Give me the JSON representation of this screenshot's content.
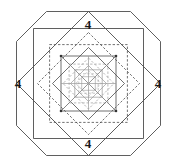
{
  "figure": {
    "type": "geometric-diagram",
    "width": 177,
    "height": 167,
    "background_color": "#ffffff",
    "stroke_color": "#4d4d4d",
    "stroke_color_light": "#9a9a9a",
    "stroke_color_dark": "#333333",
    "label_color": "#1a1a1a"
  },
  "labels": {
    "top": "4",
    "left": "4",
    "right": "4",
    "bottom": "4"
  },
  "geometry": {
    "center": {
      "x": 88.5,
      "y": 83.5
    },
    "octagon": {
      "name": "outer-octagon",
      "half_width": 72,
      "cut": 30,
      "stroke": "solid"
    },
    "levels": [
      {
        "level": 0,
        "shape": "square",
        "half_size": 55.0,
        "stroke": "solid",
        "weight": 0.9
      },
      {
        "level": 0,
        "shape": "diamond",
        "half_size": 72.0,
        "stroke": "solid",
        "weight": 0.9
      },
      {
        "level": 1,
        "shape": "square",
        "half_size": 38.9,
        "stroke": "dashed",
        "weight": 0.8
      },
      {
        "level": 1,
        "shape": "diamond",
        "half_size": 51.0,
        "stroke": "dashed",
        "weight": 0.8
      },
      {
        "level": 2,
        "shape": "square",
        "half_size": 27.5,
        "stroke": "solid",
        "weight": 0.8
      },
      {
        "level": 2,
        "shape": "diamond",
        "half_size": 36.0,
        "stroke": "solid",
        "weight": 0.8
      },
      {
        "level": 3,
        "shape": "square",
        "half_size": 19.4,
        "stroke": "dashed",
        "weight": 0.7
      },
      {
        "level": 3,
        "shape": "diamond",
        "half_size": 25.5,
        "stroke": "dashed",
        "weight": 0.7
      },
      {
        "level": 4,
        "shape": "square",
        "half_size": 13.7,
        "stroke": "solid",
        "weight": 0.7
      },
      {
        "level": 4,
        "shape": "diamond",
        "half_size": 18.0,
        "stroke": "solid",
        "weight": 0.7
      },
      {
        "level": 5,
        "shape": "square",
        "half_size": 9.7,
        "stroke": "dashed",
        "weight": 0.6
      },
      {
        "level": 5,
        "shape": "diamond",
        "half_size": 12.7,
        "stroke": "dashed",
        "weight": 0.6
      },
      {
        "level": 6,
        "shape": "square",
        "half_size": 6.8,
        "stroke": "solid",
        "weight": 0.6
      }
    ],
    "diagonals": {
      "present": true,
      "description": "cross diagonals drawn inside the central squares"
    },
    "vertex_dots": [
      {
        "x": -27.5,
        "y": -27.5
      },
      {
        "x": 27.5,
        "y": -27.5
      },
      {
        "x": -27.5,
        "y": 27.5
      },
      {
        "x": 27.5,
        "y": 27.5
      }
    ]
  }
}
